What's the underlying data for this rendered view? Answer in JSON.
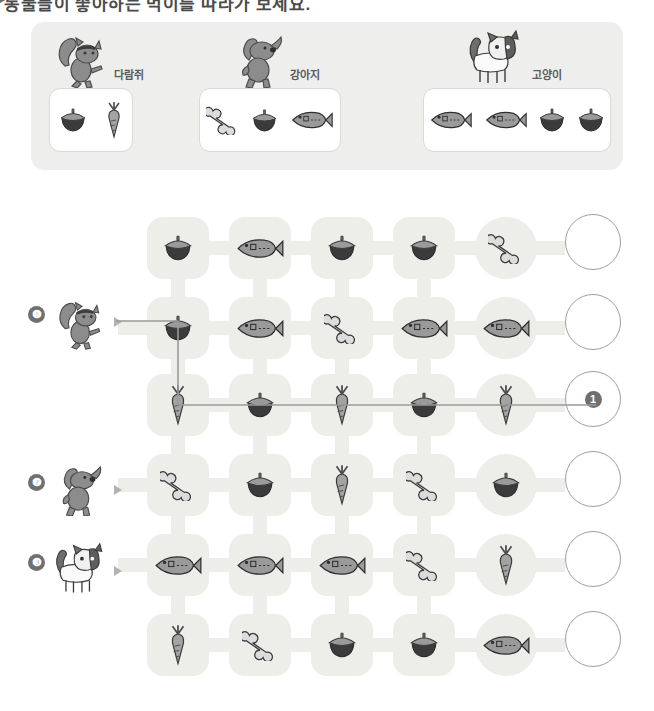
{
  "heading": {
    "text": "동물들이 좋아하는 먹이를 따라가 보세요.",
    "marker_icon": "triangle-right-icon"
  },
  "legend": {
    "groups": [
      {
        "animal_icon": "squirrel-icon",
        "label": "다람쥐",
        "foods": [
          "acorn",
          "carrot"
        ]
      },
      {
        "animal_icon": "dog-icon",
        "label": "강아지",
        "foods": [
          "bone",
          "acorn",
          "fish"
        ]
      },
      {
        "animal_icon": "cat-icon",
        "label": "고양이",
        "foods": [
          "fish",
          "fish",
          "acorn",
          "acorn"
        ]
      }
    ]
  },
  "starts": [
    {
      "number": "❶",
      "animal_icon": "squirrel-icon",
      "row": 1
    },
    {
      "number": "❷",
      "animal_icon": "dog-icon",
      "row": 3
    },
    {
      "number": "❸",
      "animal_icon": "cat-icon",
      "row": 4
    }
  ],
  "maze": {
    "rows": [
      {
        "cells": [
          "acorn",
          "fish",
          "acorn",
          "acorn",
          "bone"
        ],
        "goal": ""
      },
      {
        "cells": [
          "acorn",
          "fish",
          "bone",
          "fish",
          "fish"
        ],
        "goal": ""
      },
      {
        "cells": [
          "carrot",
          "acorn",
          "carrot",
          "acorn",
          "carrot"
        ],
        "goal": "❶"
      },
      {
        "cells": [
          "bone",
          "acorn",
          "carrot",
          "bone",
          "acorn"
        ],
        "goal": ""
      },
      {
        "cells": [
          "fish",
          "fish",
          "fish",
          "bone",
          "carrot"
        ],
        "goal": ""
      },
      {
        "cells": [
          "carrot",
          "bone",
          "acorn",
          "acorn",
          "fish"
        ],
        "goal": ""
      }
    ]
  },
  "answer_path": {
    "for": "❶",
    "description": "squirrel enters row 2 col 1 (acorn), drops to row 3 col 1 (carrot), then travels right across row 3 to the goal circle",
    "color": "#9a9a9a"
  },
  "colors": {
    "panel_bg": "#eeeeec",
    "cell_bg": "#ededea",
    "box_bg": "#ffffff",
    "badge_bg": "#6f6f6f",
    "outline": "#9d9d9d"
  }
}
